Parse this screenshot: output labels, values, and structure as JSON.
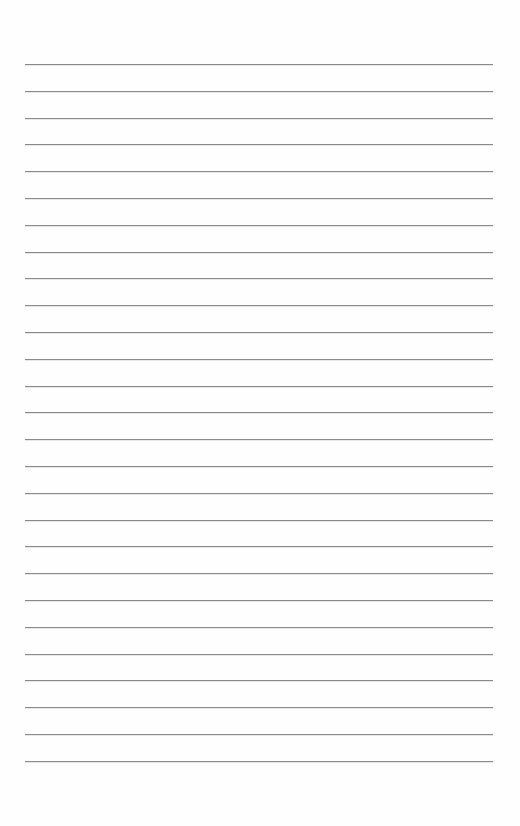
{
  "page": {
    "type": "lined-paper",
    "background_color": "#fefefe",
    "line_color": "#8a8a8a",
    "line_count": 27,
    "first_line_y": 64,
    "line_spacing": 26.8,
    "line_left": 25,
    "line_right": 493,
    "lines": [
      "",
      "",
      "",
      "",
      "",
      "",
      "",
      "",
      "",
      "",
      "",
      "",
      "",
      "",
      "",
      "",
      "",
      "",
      "",
      "",
      "",
      "",
      "",
      "",
      "",
      "",
      ""
    ]
  }
}
